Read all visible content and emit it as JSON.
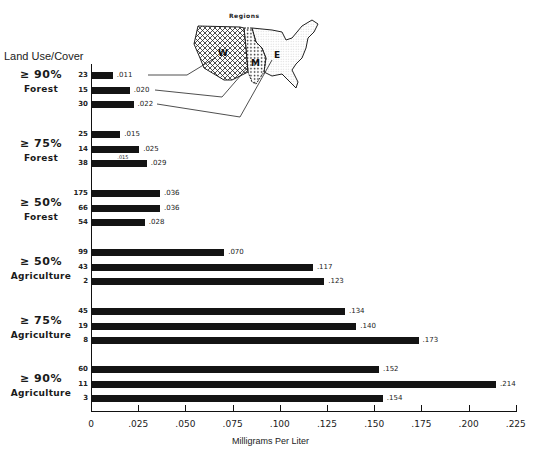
{
  "chart_data": {
    "type": "bar",
    "orientation": "horizontal",
    "title": "Land Use/Cover",
    "xlabel": "Milligrams Per Liter",
    "ylabel": "Land Use/Cover",
    "xlim": [
      0,
      0.225
    ],
    "x_ticks": [
      "0",
      ".025",
      ".050",
      ".075",
      ".100",
      ".125",
      ".150",
      ".175",
      ".200",
      ".225"
    ],
    "grid": false,
    "legend": {
      "title": "Regions",
      "entries": [
        "W",
        "M",
        "E"
      ],
      "position": "top-center (inset US map)"
    },
    "series_order_within_group": [
      "W",
      "M",
      "E"
    ],
    "groups": [
      {
        "pct": "≥ 90%",
        "cover": "Forest",
        "bars": [
          {
            "region": "W",
            "n": "23",
            "value": 0.011,
            "label": ".011"
          },
          {
            "region": "M",
            "n": "15",
            "value": 0.02,
            "label": ".020"
          },
          {
            "region": "E",
            "n": "30",
            "value": 0.022,
            "label": ".022"
          }
        ]
      },
      {
        "pct": "≥ 75%",
        "cover": "Forest",
        "bars": [
          {
            "region": "W",
            "n": "25",
            "value": 0.015,
            "label": ".015"
          },
          {
            "region": "M",
            "n": "14",
            "value": 0.025,
            "label": ".025"
          },
          {
            "region": "E",
            "n": "38",
            "value": 0.029,
            "label": ".029",
            "note": ".015"
          }
        ]
      },
      {
        "pct": "≥ 50%",
        "cover": "Forest",
        "bars": [
          {
            "region": "W",
            "n": "175",
            "value": 0.036,
            "label": ".036"
          },
          {
            "region": "M",
            "n": "66",
            "value": 0.036,
            "label": ".036"
          },
          {
            "region": "E",
            "n": "54",
            "value": 0.028,
            "label": ".028"
          }
        ]
      },
      {
        "pct": "≥ 50%",
        "cover": "Agriculture",
        "bars": [
          {
            "region": "W",
            "n": "99",
            "value": 0.07,
            "label": ".070"
          },
          {
            "region": "M",
            "n": "43",
            "value": 0.117,
            "label": ".117"
          },
          {
            "region": "E",
            "n": "2",
            "value": 0.123,
            "label": ".123"
          }
        ]
      },
      {
        "pct": "≥ 75%",
        "cover": "Agriculture",
        "bars": [
          {
            "region": "W",
            "n": "45",
            "value": 0.134,
            "label": ".134"
          },
          {
            "region": "M",
            "n": "19",
            "value": 0.14,
            "label": ".140"
          },
          {
            "region": "E",
            "n": "8",
            "value": 0.173,
            "label": ".173"
          }
        ]
      },
      {
        "pct": "≥ 90%",
        "cover": "Agriculture",
        "bars": [
          {
            "region": "W",
            "n": "60",
            "value": 0.152,
            "label": ".152"
          },
          {
            "region": "M",
            "n": "11",
            "value": 0.214,
            "label": ".214"
          },
          {
            "region": "E",
            "n": "3",
            "value": 0.154,
            "label": ".154"
          }
        ]
      }
    ]
  },
  "labels": {
    "title": "Land Use/Cover",
    "xlabel": "Milligrams Per Liter",
    "regions_title": "Regions",
    "region_w": "W",
    "region_m": "M",
    "region_e": "E"
  },
  "colors": {
    "bar": "#141414",
    "axis": "#111111",
    "background": "#ffffff"
  }
}
